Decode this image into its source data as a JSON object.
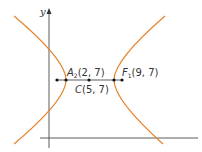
{
  "figure": {
    "axis_y_label": "y",
    "curve_color": "#e8822a",
    "axis_color": "#333333",
    "points": [
      {
        "id": "A2",
        "name": "A",
        "sub": "2",
        "coords": "(2, 7)"
      },
      {
        "id": "C",
        "name": "C",
        "sub": "",
        "coords": "(5, 7)"
      },
      {
        "id": "F",
        "name": "F",
        "sub": "1",
        "coords": "(9, 7)"
      }
    ]
  }
}
